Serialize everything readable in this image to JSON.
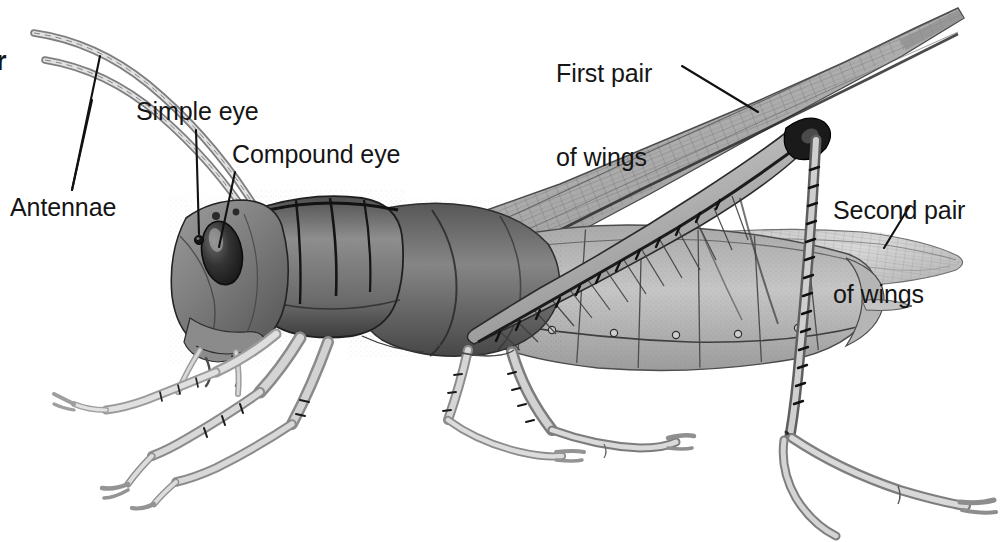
{
  "figure": {
    "style": "grayscale pen-and-ink scientific illustration",
    "background_color": "#ffffff",
    "label_color": "#151515",
    "width": 1004,
    "height": 542
  },
  "labels": {
    "partial_left": "r",
    "antennae": "Antennae",
    "simple_eye": "Simple eye",
    "compound_eye": "Compound eye",
    "first_pair_line1": "First pair",
    "first_pair_line2": "of wings",
    "second_pair_line1": "Second pair",
    "second_pair_line2": "of wings"
  },
  "callouts": [
    {
      "name": "antennae",
      "text": "Antennae",
      "targets": 2
    },
    {
      "name": "simple-eye",
      "text": "Simple eye",
      "targets": 1
    },
    {
      "name": "compound-eye",
      "text": "Compound eye",
      "targets": 1
    },
    {
      "name": "first-pair-of-wings",
      "text": "First pair of wings",
      "targets": 1
    },
    {
      "name": "second-pair-of-wings",
      "text": "Second pair of wings",
      "targets": 1
    }
  ],
  "anatomy_parts": [
    "antenna-upper",
    "antenna-lower",
    "head",
    "compound-eye",
    "simple-eye",
    "pronotum",
    "thorax",
    "forewing",
    "hindwing",
    "abdomen",
    "foreleg",
    "midleg",
    "hindleg-femur",
    "hindleg-tibia",
    "tarsus"
  ],
  "palette": {
    "ink": "#151515",
    "dark_shade": "#3a3a3a",
    "mid_shade": "#7b7b7b",
    "light_shade": "#b9b9b9",
    "pale_shade": "#dcdcdc",
    "paper": "#ffffff"
  }
}
